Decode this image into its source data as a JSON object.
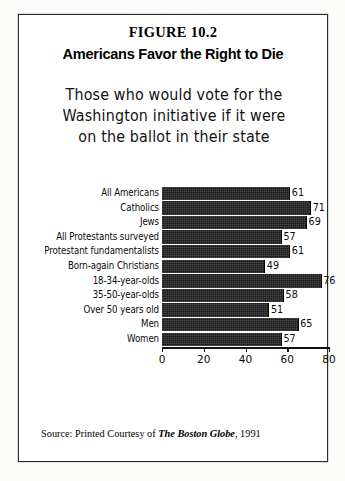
{
  "figure": {
    "number": "FIGURE 10.2",
    "title": "Americans Favor the Right to Die",
    "subtitle_line1": "Those who would vote for the",
    "subtitle_line2": "Washington initiative if it were",
    "subtitle_line3": "on the ballot in their state",
    "source_prefix": "Source:  Printed Courtesy of",
    "source_publication": "The Boston Globe",
    "source_suffix": ", 1991"
  },
  "chart_data": {
    "type": "bar",
    "orientation": "horizontal",
    "title": "Americans Favor the Right to Die",
    "subtitle": "Those who would vote for the Washington initiative if it were on the ballot in their state",
    "categories": [
      "All Americans",
      "Catholics",
      "Jews",
      "All Protestants surveyed",
      "Protestant fundamentalists",
      "Born-again Christians",
      "18-34-year-olds",
      "35-50-year-olds",
      "Over 50 years old",
      "Men",
      "Women"
    ],
    "values": [
      61,
      71,
      69,
      57,
      61,
      49,
      76,
      58,
      51,
      65,
      57
    ],
    "xlabel": "",
    "ylabel": "",
    "xlim": [
      0,
      80
    ],
    "xticks": [
      0,
      20,
      40,
      60,
      80
    ],
    "xtick_labels": [
      "0",
      "20",
      "40",
      "60",
      "80"
    ],
    "grid": false,
    "legend": false,
    "bar_color": "#1a1a1a",
    "data_labels": [
      "61",
      "71",
      "69",
      "57",
      "61",
      "49",
      "76",
      "58",
      "51",
      "65",
      "57"
    ]
  }
}
